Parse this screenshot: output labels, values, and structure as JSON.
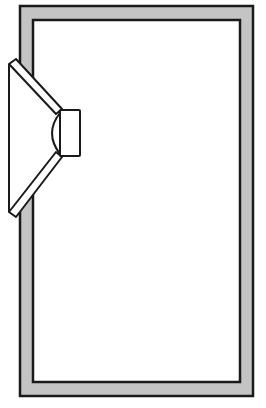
{
  "diagram": {
    "title": "",
    "type": "loudspeaker-enclosure-cross-section",
    "components": [
      {
        "id": "enclosure",
        "label": "enclosure-wall"
      },
      {
        "id": "driver",
        "label": "loudspeaker-driver"
      }
    ],
    "colors": {
      "wall_fill": "#c4c4c4",
      "stroke": "#1a1a1a",
      "background": "#ffffff"
    }
  }
}
